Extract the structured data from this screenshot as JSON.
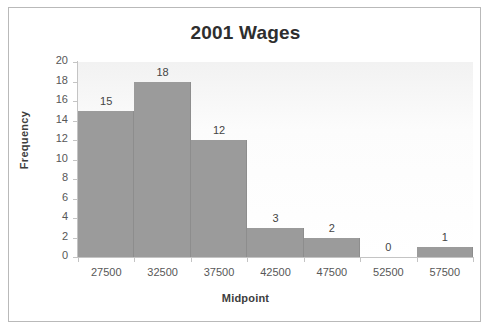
{
  "chart_data": {
    "type": "bar",
    "title": "2001 Wages",
    "xlabel": "Midpoint",
    "ylabel": "Frequency",
    "categories": [
      "27500",
      "32500",
      "37500",
      "42500",
      "47500",
      "52500",
      "57500"
    ],
    "values": [
      15,
      18,
      12,
      3,
      2,
      0,
      1
    ],
    "data_labels": [
      "15",
      "18",
      "12",
      "3",
      "2",
      "0",
      "1"
    ],
    "ylim": [
      0,
      20
    ],
    "ytick_step": 2,
    "yticks": [
      "0",
      "2",
      "4",
      "6",
      "8",
      "10",
      "12",
      "14",
      "16",
      "18",
      "20"
    ],
    "grid": false,
    "legend": "none",
    "bar_gap": 0,
    "series_name": "Frequency",
    "colors": {
      "bar_fill": "#9b9b9b",
      "bar_edge": "#8d8d8d",
      "plot_background": "#fbfbfb",
      "axis_line": "#c4c4c4",
      "title_text": "#2e2e2e",
      "tick_text": "#575757",
      "axis_title_text": "#3d3d3d",
      "frame_border": "#b9b9b9",
      "page_background": "#ffffff"
    }
  }
}
